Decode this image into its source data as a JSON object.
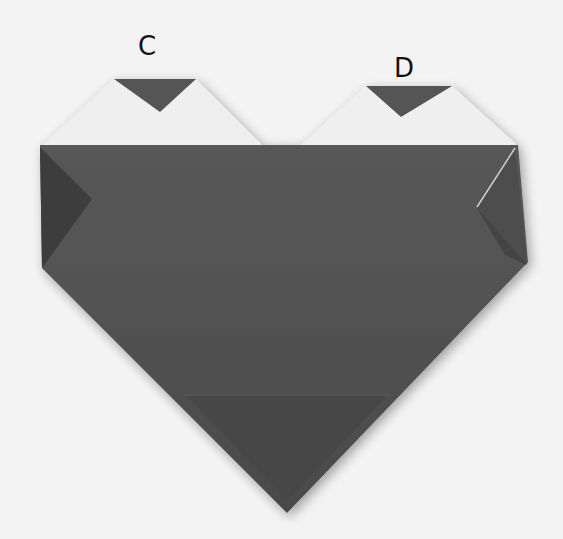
{
  "figure": {
    "labels": [
      {
        "id": "C",
        "text": "C"
      },
      {
        "id": "D",
        "text": "D"
      }
    ],
    "colors": {
      "background": "#f3f3f3",
      "paper_dark": "#555555",
      "paper_darker": "#3f3f3f",
      "paper_light": "#eeeeee",
      "label": "#111111"
    }
  }
}
